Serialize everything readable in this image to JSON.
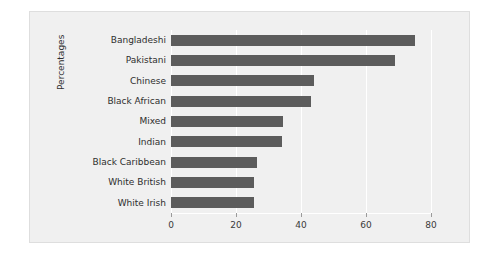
{
  "chart_data": {
    "type": "bar",
    "orientation": "horizontal",
    "title": "",
    "xlabel": "",
    "ylabel": "Percentages",
    "categories": [
      "Bangladeshi",
      "Pakistani",
      "Chinese",
      "Black African",
      "Mixed",
      "Indian",
      "Black Caribbean",
      "White British",
      "White Irish"
    ],
    "values": [
      75,
      69,
      44,
      43,
      34.5,
      34,
      26.5,
      25.5,
      25.5
    ],
    "xlim": [
      0,
      80
    ],
    "xticks": [
      0,
      20,
      40,
      60,
      80
    ],
    "xtick_labels": [
      "0",
      "20",
      "40",
      "60",
      "80"
    ],
    "grid": "vertical-white",
    "legend": "none",
    "bar_color": "#5c5c5c",
    "plot_background": "#f0f0f0",
    "panel_border": "#dedede"
  }
}
